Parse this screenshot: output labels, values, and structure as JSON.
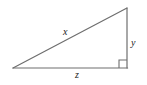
{
  "figure": {
    "name": "right-triangle-diagram",
    "background_color": "#ffffff",
    "stroke_color": "#6e6e6e",
    "label_color": "#222222",
    "labels": {
      "hypotenuse": "x",
      "vertical_leg": "y",
      "base_leg": "z"
    },
    "right_angle_marker": "right-angle-square",
    "geometry": {
      "left_vertex": [
        13,
        68
      ],
      "right_angle_vertex": [
        127,
        68
      ],
      "apex_vertex": [
        127,
        8
      ],
      "right_angle_size": 8
    }
  }
}
